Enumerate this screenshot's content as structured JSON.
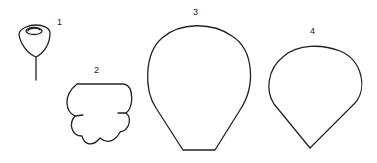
{
  "figure": {
    "labels": [
      {
        "id": "1",
        "text": "1"
      },
      {
        "id": "2",
        "text": "2"
      },
      {
        "id": "3",
        "text": "3"
      },
      {
        "id": "4",
        "text": "4"
      }
    ],
    "stroke_color": "#222222",
    "background": "#ffffff"
  }
}
